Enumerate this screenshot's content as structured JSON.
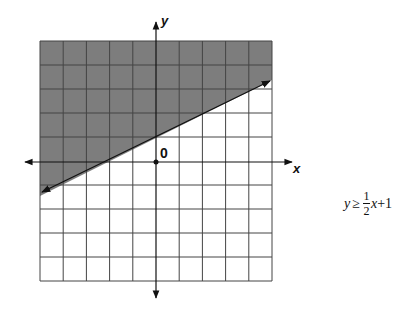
{
  "figure": {
    "axis_labels": {
      "x": "x",
      "y": "y"
    },
    "origin_label": "0",
    "inequality": {
      "lhs": "y",
      "relation": "≥",
      "coef_num": "1",
      "coef_den": "2",
      "var": "x",
      "const": "+1",
      "full_text": "y ≥ 1/2 x + 1"
    },
    "grid": {
      "xmin": -5,
      "xmax": 5,
      "ymin": -5,
      "ymax": 5,
      "step": 1
    },
    "boundary_line": {
      "slope": 0.5,
      "intercept": 1,
      "style": "solid",
      "arrows": true
    },
    "shaded_region": "above",
    "colors": {
      "shade": "#7d7d7d",
      "grid": "#444444",
      "axis": "#111111",
      "background": "#ffffff"
    }
  }
}
